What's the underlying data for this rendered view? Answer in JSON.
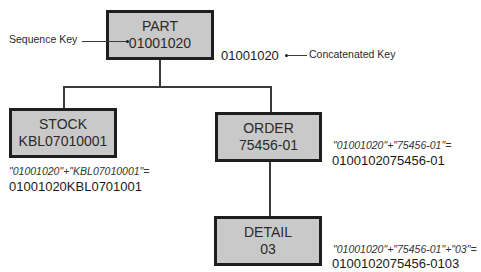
{
  "nodes": {
    "part": {
      "title": "PART",
      "key": "01001020"
    },
    "stock": {
      "title": "STOCK",
      "key": "KBL07010001"
    },
    "order": {
      "title": "ORDER",
      "key": "75456-01"
    },
    "detail": {
      "title": "DETAIL",
      "key": "03"
    }
  },
  "annotations": {
    "sequence_key_label": "Sequence Key",
    "concatenated_key_value": "01001020",
    "concatenated_key_label": "Concatenated Key"
  },
  "formulas": {
    "stock": {
      "expression": "\"01001020\"+\"KBL07010001\"=",
      "result": "01001020KBL0701001"
    },
    "order": {
      "expression": "\"01001020\"+\"75456-01\"=",
      "result": "0100102075456-01"
    },
    "detail": {
      "expression": "\"01001020\"+\"75456-01\"+\"03\"=",
      "result": "0100102075456-0103"
    }
  }
}
